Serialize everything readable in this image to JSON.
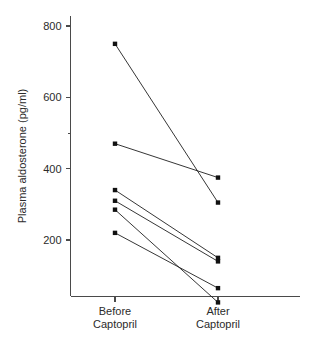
{
  "chart_data": {
    "type": "line",
    "title": "",
    "xlabel": "",
    "ylabel": "Plasma aldosterone (pg/ml)",
    "categories": [
      "Before Captopril",
      "After Captopril"
    ],
    "category_lines": [
      [
        "Before",
        "Captopril"
      ],
      [
        "After",
        "Captopril"
      ]
    ],
    "ytick_labels": [
      "200",
      "400",
      "600",
      "800"
    ],
    "ytick_values": [
      200,
      400,
      600,
      800
    ],
    "ylim": [
      0,
      860
    ],
    "grid": false,
    "legend": "none",
    "marker": "square",
    "series": [
      {
        "name": "subject-1",
        "values": [
          750,
          305
        ]
      },
      {
        "name": "subject-2",
        "values": [
          470,
          375
        ]
      },
      {
        "name": "subject-3",
        "values": [
          340,
          150
        ]
      },
      {
        "name": "subject-4",
        "values": [
          310,
          140
        ]
      },
      {
        "name": "subject-5",
        "values": [
          285,
          25
        ]
      },
      {
        "name": "subject-6",
        "values": [
          220,
          65
        ]
      }
    ]
  },
  "axes": {
    "y_axis_name": "y-axis",
    "x_axis_name": "x-axis"
  }
}
